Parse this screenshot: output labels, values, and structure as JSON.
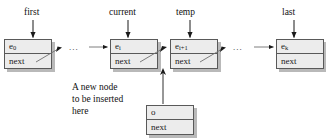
{
  "diagram": {
    "colors": {
      "node_fill": "#ececec",
      "node_border": "#595959",
      "node_shadow": "#b9b9b9",
      "arrow": "#1a1a1a",
      "text": "#111111",
      "background": "#ffffff"
    },
    "pointer_labels": [
      {
        "name": "first",
        "target": "node-e0"
      },
      {
        "name": "current",
        "target": "node-ei"
      },
      {
        "name": "temp",
        "target": "node-ei1"
      },
      {
        "name": "last",
        "target": "node-ek"
      }
    ],
    "nodes": [
      {
        "id": "node-e0",
        "data": "e",
        "subscript": "0",
        "link_field": "next"
      },
      {
        "id": "node-ei",
        "data": "e",
        "subscript": "i",
        "link_field": "next"
      },
      {
        "id": "node-ei1",
        "data": "e",
        "subscript": "i+1",
        "link_field": "next"
      },
      {
        "id": "node-ek",
        "data": "e",
        "subscript": "k",
        "link_field": "next"
      },
      {
        "id": "node-o",
        "data": "o",
        "subscript": "",
        "link_field": "next"
      }
    ],
    "ellipses": [
      {
        "id": "ellipsis-1",
        "text": "..."
      },
      {
        "id": "ellipsis-2",
        "text": "..."
      }
    ],
    "caption": {
      "line1": "A new node",
      "line2": "to be inserted",
      "line3": "here"
    }
  }
}
